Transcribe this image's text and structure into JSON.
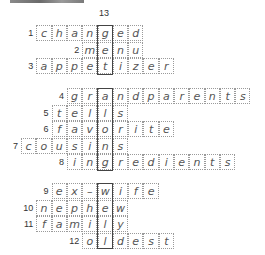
{
  "puzzle": {
    "column_label": "13",
    "highlight_column": 5,
    "cell_width": 15.3,
    "origin_x": 21,
    "sections": [
      {
        "highlight_top": 25,
        "highlight_rows": 3,
        "rows": [
          {
            "number": "1",
            "word": "changed",
            "start_col": 1,
            "y": 25
          },
          {
            "number": "2",
            "word": "menu",
            "start_col": 4,
            "y": 41.5
          },
          {
            "number": "3",
            "word": "appetizer",
            "start_col": 1,
            "y": 58
          }
        ]
      },
      {
        "highlight_top": 88,
        "highlight_rows": 5,
        "rows": [
          {
            "number": "4",
            "word": "grandparents",
            "start_col": 3,
            "y": 88
          },
          {
            "number": "5",
            "word": "tells",
            "start_col": 2,
            "y": 104.5
          },
          {
            "number": "6",
            "word": "favorite",
            "start_col": 2,
            "y": 121
          },
          {
            "number": "7",
            "word": "cousins",
            "start_col": 0,
            "y": 137.5
          },
          {
            "number": "8",
            "word": "ingredients",
            "start_col": 3,
            "y": 154
          }
        ]
      },
      {
        "highlight_top": 183,
        "highlight_rows": 4,
        "rows": [
          {
            "number": "9",
            "word": "ex–wife",
            "start_col": 2,
            "y": 183
          },
          {
            "number": "10",
            "word": "nephew",
            "start_col": 1,
            "y": 199.5
          },
          {
            "number": "11",
            "word": "family",
            "start_col": 1,
            "y": 216
          },
          {
            "number": "12",
            "word": "oldest",
            "start_col": 4,
            "y": 232.5
          }
        ]
      }
    ]
  }
}
